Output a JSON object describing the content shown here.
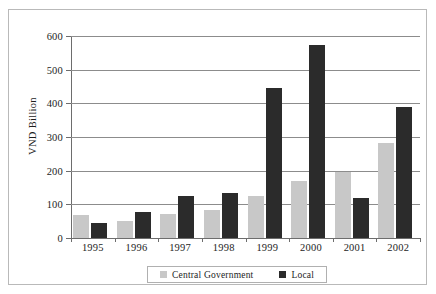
{
  "chart_data": {
    "type": "bar",
    "title": "",
    "xlabel": "",
    "ylabel": "VND Billion",
    "ylim": [
      0,
      600
    ],
    "ytick_values": [
      600,
      500,
      400,
      300,
      200,
      100,
      0
    ],
    "ytick_labels": [
      "600",
      "500",
      "400",
      "300",
      "200",
      "100",
      "0"
    ],
    "grid": "horizontal",
    "legend_position": "bottom",
    "categories": [
      "1995",
      "1996",
      "1997",
      "1998",
      "1999",
      "2000",
      "2001",
      "2002"
    ],
    "series": [
      {
        "name": "Central Government",
        "color": "#c8c8c8",
        "values": [
          67,
          52,
          72,
          84,
          125,
          170,
          196,
          282
        ]
      },
      {
        "name": "Local",
        "color": "#2b2b2b",
        "values": [
          45,
          78,
          125,
          133,
          447,
          573,
          119,
          388
        ]
      }
    ]
  },
  "legend": {
    "items": [
      {
        "label": "Central Government",
        "swatch": "central"
      },
      {
        "label": "Local",
        "swatch": "local"
      }
    ]
  }
}
